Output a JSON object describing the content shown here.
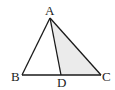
{
  "diagram": {
    "points": {
      "A": {
        "label": "A"
      },
      "B": {
        "label": "B"
      },
      "C": {
        "label": "C"
      },
      "D": {
        "label": "D"
      }
    },
    "segments": [
      "AB",
      "AC",
      "BC",
      "AD"
    ],
    "shaded_region": "triangle ADC",
    "colors": {
      "stroke": "#1a1a1a",
      "shade": "#ebebeb"
    }
  }
}
